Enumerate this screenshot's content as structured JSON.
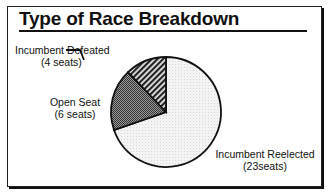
{
  "chart_data": {
    "type": "pie",
    "title": "Type of Race Breakdown",
    "categories": [
      "Incumbent Reelected",
      "Open Seat",
      "Incumbent Defeated"
    ],
    "values": [
      23,
      6,
      4
    ],
    "units": "seats",
    "labels": [
      {
        "name": "Incumbent Defeated",
        "detail": "(4 seats)"
      },
      {
        "name": "Open Seat",
        "detail": "(6 seats)"
      },
      {
        "name": "Incumbent Reelected",
        "detail": "(23seats)"
      }
    ],
    "fills": {
      "Incumbent Reelected": "light dotted",
      "Open Seat": "dark crosshatch",
      "Incumbent Defeated": "diagonal stripes"
    }
  },
  "header": {
    "title": "Type of Race Breakdown"
  },
  "labels": {
    "defeated_name": "Incumbent Defeated",
    "defeated_detail": "(4 seats)",
    "open_name": "Open Seat",
    "open_detail": "(6 seats)",
    "reelected_name": "Incumbent Reelected",
    "reelected_detail": "(23seats)"
  }
}
